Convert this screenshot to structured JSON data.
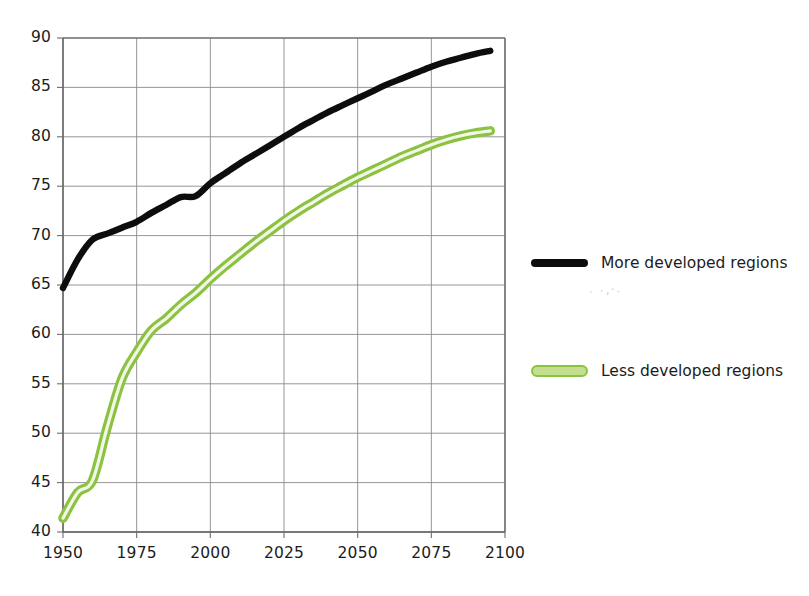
{
  "chart_data": {
    "type": "line",
    "title": "",
    "subtitle": "",
    "xlabel": "",
    "ylabel": "",
    "xlim": [
      1950,
      2100
    ],
    "ylim": [
      40,
      90
    ],
    "xticks": [
      1950,
      1975,
      2000,
      2025,
      2050,
      2075,
      2100
    ],
    "yticks": [
      40,
      45,
      50,
      55,
      60,
      65,
      70,
      75,
      80,
      85,
      90
    ],
    "grid": true,
    "legend_position": "right",
    "series": [
      {
        "name": "More developed regions",
        "color": "#0d0d0d",
        "style": "solid-thick",
        "x": [
          1950,
          1955,
          1960,
          1965,
          1970,
          1975,
          1980,
          1985,
          1990,
          1995,
          2000,
          2005,
          2010,
          2015,
          2020,
          2025,
          2030,
          2035,
          2040,
          2045,
          2050,
          2055,
          2060,
          2065,
          2070,
          2075,
          2080,
          2085,
          2090,
          2095
        ],
        "values": [
          64.7,
          67.6,
          69.6,
          70.2,
          70.8,
          71.4,
          72.3,
          73.1,
          73.9,
          74.0,
          75.3,
          76.3,
          77.3,
          78.2,
          79.1,
          80.0,
          80.9,
          81.7,
          82.5,
          83.2,
          83.9,
          84.6,
          85.3,
          85.9,
          86.5,
          87.1,
          87.6,
          88.0,
          88.4,
          88.7
        ]
      },
      {
        "name": "Less developed regions",
        "color": "#8cc241",
        "fill_color": "#c3de8e",
        "style": "outlined-thick",
        "x": [
          1950,
          1955,
          1960,
          1965,
          1970,
          1975,
          1980,
          1985,
          1990,
          1995,
          2000,
          2005,
          2010,
          2015,
          2020,
          2025,
          2030,
          2035,
          2040,
          2045,
          2050,
          2055,
          2060,
          2065,
          2070,
          2075,
          2080,
          2085,
          2090,
          2095
        ],
        "values": [
          41.4,
          44.0,
          45.2,
          50.6,
          55.5,
          58.2,
          60.4,
          61.6,
          63.0,
          64.2,
          65.6,
          66.9,
          68.1,
          69.3,
          70.4,
          71.5,
          72.5,
          73.4,
          74.3,
          75.1,
          75.9,
          76.6,
          77.3,
          78.0,
          78.6,
          79.2,
          79.7,
          80.1,
          80.4,
          80.6
        ]
      }
    ]
  },
  "legend": {
    "entries": [
      {
        "label": "More developed regions",
        "swatch": "black-line-swatch"
      },
      {
        "label": "Less developed regions",
        "swatch": "green-line-swatch"
      }
    ]
  }
}
